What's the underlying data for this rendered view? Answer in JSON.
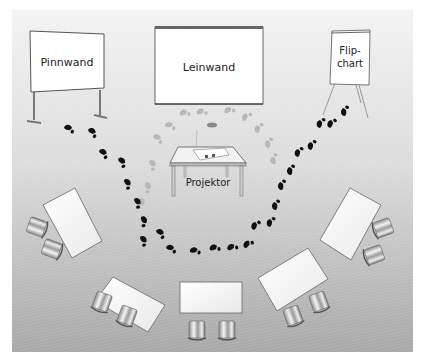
{
  "diagram": {
    "type": "room-layout",
    "colors": {
      "background_top": "#f2f2f2",
      "background_bottom": "#a9a9a9",
      "board_fill": "#ffffff",
      "board_stroke": "#555555",
      "footprint_dark": "#111111",
      "footprint_light": "#b5b5b5"
    },
    "media": [
      {
        "id": "pinnwand",
        "label": "Pinnwand"
      },
      {
        "id": "leinwand",
        "label": "Leinwand"
      },
      {
        "id": "flipchart",
        "label_line1": "Flip-",
        "label_line2": "chart"
      }
    ],
    "projector": {
      "label": "Projektor"
    },
    "tables": {
      "count": 5,
      "chairs_per_table": 2
    },
    "paths": [
      {
        "name": "presenter-path-outer",
        "style": "dark footprints"
      },
      {
        "name": "presenter-path-inner",
        "style": "light footprints"
      }
    ]
  }
}
